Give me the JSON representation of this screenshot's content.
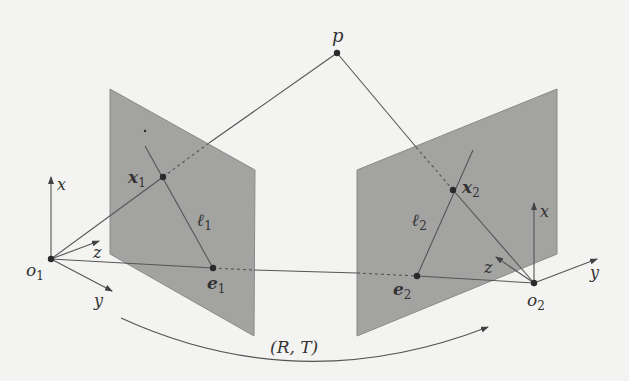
{
  "figure": {
    "colors": {
      "background": "#f3f3f1",
      "plane": "#a3a3a2",
      "line": "#555555",
      "point": "#2a2a2a"
    },
    "labels": {
      "p": "p",
      "x1": "x",
      "x1_sub": "1",
      "x2": "x",
      "x2_sub": "2",
      "l1": "ℓ",
      "l1_sub": "1",
      "l2": "ℓ",
      "l2_sub": "2",
      "e1": "e",
      "e1_sub": "1",
      "e2": "e",
      "e2_sub": "2",
      "o1": "o",
      "o1_sub": "1",
      "o2": "o",
      "o2_sub": "2",
      "cam1_x": "x",
      "cam1_y": "y",
      "cam1_z": "z",
      "cam2_x": "x",
      "cam2_y": "y",
      "cam2_z": "z",
      "transform": "(R, T)"
    },
    "points": {
      "p": [
        337,
        53
      ],
      "x1": [
        163,
        177
      ],
      "x2": [
        453,
        190
      ],
      "e1": [
        213,
        268
      ],
      "e2": [
        417,
        276
      ],
      "o1": [
        51,
        259
      ],
      "o2": [
        534,
        283
      ]
    }
  }
}
